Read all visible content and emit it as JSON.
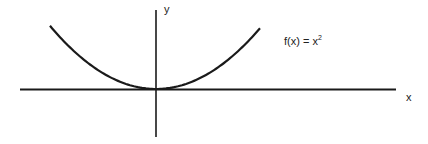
{
  "chart_data": {
    "type": "line",
    "title": "",
    "function_label": "f(x) = x",
    "function_exponent": "2",
    "xlabel": "x",
    "ylabel": "y",
    "grid": false,
    "ticks": "none",
    "series": [
      {
        "name": "f(x) = x^2",
        "x": [
          -3,
          -2,
          -1,
          0,
          1,
          2,
          3
        ],
        "y": [
          9,
          4,
          1,
          0,
          1,
          4,
          9
        ]
      }
    ],
    "colors": {
      "curve": "#1a1a1a",
      "axes": "#1a1a1a",
      "background": "#ffffff"
    }
  }
}
